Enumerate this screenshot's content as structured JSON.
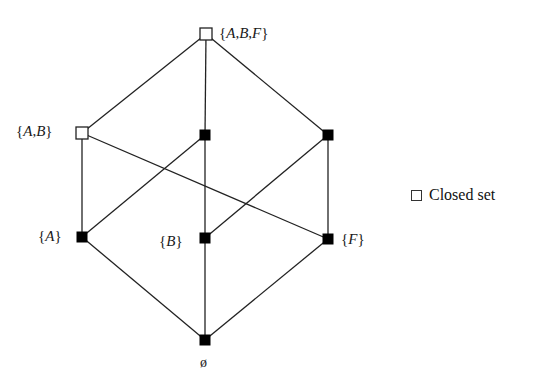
{
  "diagram": {
    "type": "lattice",
    "nodes": [
      {
        "id": "ABF",
        "label": "{A,B,F}",
        "closed": true,
        "x": 206,
        "y": 34
      },
      {
        "id": "AB",
        "label": "{A,B}",
        "closed": true,
        "x": 82,
        "y": 133
      },
      {
        "id": "AF",
        "label": "",
        "closed": false,
        "x": 205,
        "y": 135
      },
      {
        "id": "BF",
        "label": "",
        "closed": false,
        "x": 328,
        "y": 135
      },
      {
        "id": "A",
        "label": "{A}",
        "closed": false,
        "x": 82,
        "y": 237
      },
      {
        "id": "B",
        "label": "{B}",
        "closed": false,
        "x": 205,
        "y": 238
      },
      {
        "id": "F",
        "label": "{F}",
        "closed": false,
        "x": 328,
        "y": 239
      },
      {
        "id": "EMPTY",
        "label": "ø",
        "closed": false,
        "x": 205,
        "y": 340
      }
    ],
    "edges": [
      [
        "ABF",
        "AB"
      ],
      [
        "ABF",
        "AF"
      ],
      [
        "ABF",
        "BF"
      ],
      [
        "AB",
        "A"
      ],
      [
        "AB",
        "F"
      ],
      [
        "AF",
        "A"
      ],
      [
        "AF",
        "B"
      ],
      [
        "BF",
        "B"
      ],
      [
        "BF",
        "F"
      ],
      [
        "A",
        "EMPTY"
      ],
      [
        "B",
        "EMPTY"
      ],
      [
        "F",
        "EMPTY"
      ]
    ],
    "labels": {
      "ABF": "{A,B,F}",
      "AB": "{A,B}",
      "A": "{A}",
      "B": "{B}",
      "F": "{F}",
      "EMPTY": "ø"
    }
  },
  "legend": {
    "closed_symbol": "open-square",
    "closed_label": "Closed set"
  },
  "colors": {
    "line": "#222222",
    "filled_node": "#000000",
    "open_node_fill": "#ffffff"
  }
}
